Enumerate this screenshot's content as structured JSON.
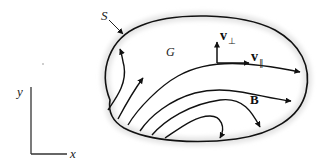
{
  "figure": {
    "labels": {
      "surface": "S",
      "region": "G",
      "field": "B",
      "v_perp_main": "v",
      "v_perp_sub": "⊥",
      "v_par_main": "v",
      "v_par_sub": "∥",
      "axis_x": "x",
      "axis_y": "y"
    },
    "colors": {
      "line": "#111111",
      "halo": "#e4e4e4",
      "background": "#ffffff"
    }
  }
}
